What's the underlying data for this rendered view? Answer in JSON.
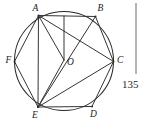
{
  "figure": {
    "caption": "",
    "side_number": "135",
    "vertices": [
      {
        "id": "A",
        "label": "A",
        "x": 38.5,
        "y": 15.5,
        "label_x": 32.5,
        "label_y": 11.0
      },
      {
        "id": "B",
        "label": "B",
        "x": 95.5,
        "y": 16.5,
        "label_x": 97.5,
        "label_y": 11.0
      },
      {
        "id": "C",
        "label": "C",
        "x": 113.5,
        "y": 61.5,
        "label_x": 117.0,
        "label_y": 62.5
      },
      {
        "id": "D",
        "label": "D",
        "x": 92.0,
        "y": 106.5,
        "label_x": 90.0,
        "label_y": 117.0
      },
      {
        "id": "E",
        "label": "E",
        "x": 38.0,
        "y": 107.0,
        "label_x": 32.0,
        "label_y": 118.0
      },
      {
        "id": "F",
        "label": "F",
        "x": 14.5,
        "y": 61.5,
        "label_x": 5.5,
        "label_y": 62.5
      },
      {
        "id": "O",
        "label": "O",
        "x": 64.0,
        "y": 60.0,
        "label_x": 67.0,
        "label_y": 65.0
      }
    ],
    "circle": {
      "cx": 64.0,
      "cy": 61.0,
      "r": 49.5
    },
    "segments": [
      {
        "from": "A",
        "to": "B"
      },
      {
        "from": "A",
        "to": "C"
      },
      {
        "from": "A",
        "to": "E"
      },
      {
        "from": "A",
        "to": "F"
      },
      {
        "from": "A",
        "to": "O"
      },
      {
        "from": "B",
        "to": "C"
      },
      {
        "from": "B",
        "to": "E"
      },
      {
        "from": "C",
        "to": "D"
      },
      {
        "from": "C",
        "to": "E"
      },
      {
        "from": "D",
        "to": "E"
      },
      {
        "from": "E",
        "to": "F"
      },
      {
        "from": "E",
        "to": "O"
      }
    ],
    "perpendicular": {
      "x": 64.0,
      "y_top": 16.0,
      "y_bottom": 60.0
    },
    "side_rule": {
      "x": 136.0,
      "y_top": 3.0,
      "y_bottom": 74.0
    },
    "side_number_pos": {
      "x": 122.0,
      "y": 88.0
    }
  },
  "colors": {
    "ink": "#2a2a2a",
    "rule": "#6a6a6a",
    "background": "#ffffff"
  }
}
